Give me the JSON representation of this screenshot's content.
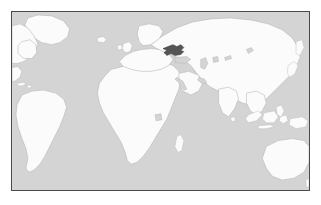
{
  "image": {
    "title": "World locator map",
    "width": 321,
    "height": 205,
    "outer_background": "#ffffff",
    "projection": "equirectangular"
  },
  "frame": {
    "name": "map-border",
    "x": 11,
    "y": 11,
    "width": 299,
    "height": 180,
    "border_color": "#4a4a4a",
    "border_width": 1
  },
  "colors": {
    "ocean": "#d4d4d4",
    "land_fill": "#fbfbfb",
    "land_stroke": "#b4b4b4",
    "highlight_fill": "#555555",
    "highlight_stroke": "#3a3a3a",
    "inland_water": "#d4d4d4"
  },
  "legend": {
    "highlighted_label": "Ukraine",
    "highlighted_region": "Eastern Europe",
    "ocean_label": "Ocean",
    "land_label": "Land"
  },
  "highlight": {
    "name": "Ukraine",
    "continent": "Europe",
    "center_x_px": 174,
    "center_y_px": 50,
    "bbox_px": [
      168,
      45,
      13,
      9
    ]
  },
  "landmasses": [
    {
      "id": "greenland",
      "label": "Greenland"
    },
    {
      "id": "north-america-east",
      "label": "North America"
    },
    {
      "id": "central-america",
      "label": "Central America"
    },
    {
      "id": "south-america",
      "label": "South America"
    },
    {
      "id": "africa",
      "label": "Africa"
    },
    {
      "id": "europe",
      "label": "Europe"
    },
    {
      "id": "eurasia",
      "label": "Asia"
    },
    {
      "id": "india",
      "label": "India"
    },
    {
      "id": "arabia",
      "label": "Arabian Peninsula"
    },
    {
      "id": "japan",
      "label": "Japan"
    },
    {
      "id": "indonesia",
      "label": "Indonesia"
    },
    {
      "id": "new-guinea",
      "label": "New Guinea"
    },
    {
      "id": "australia",
      "label": "Australia"
    },
    {
      "id": "philippines",
      "label": "Philippines"
    },
    {
      "id": "madagascar",
      "label": "Madagascar"
    },
    {
      "id": "british-isles",
      "label": "British Isles"
    },
    {
      "id": "iceland",
      "label": "Iceland"
    },
    {
      "id": "scandinavia",
      "label": "Scandinavia"
    },
    {
      "id": "sri-lanka",
      "label": "Sri Lanka"
    },
    {
      "id": "new-zealand",
      "label": "New Zealand"
    }
  ],
  "inland_waters": [
    {
      "id": "caspian-sea",
      "label": "Caspian Sea"
    },
    {
      "id": "aral-sea",
      "label": "Aral Sea"
    },
    {
      "id": "lake-baikal",
      "label": "Lake Baikal"
    },
    {
      "id": "lake-victoria",
      "label": "Lake Victoria"
    },
    {
      "id": "black-sea",
      "label": "Black Sea"
    },
    {
      "id": "mediterranean-sea",
      "label": "Mediterranean Sea"
    },
    {
      "id": "red-sea",
      "label": "Red Sea"
    },
    {
      "id": "persian-gulf",
      "label": "Persian Gulf"
    }
  ]
}
